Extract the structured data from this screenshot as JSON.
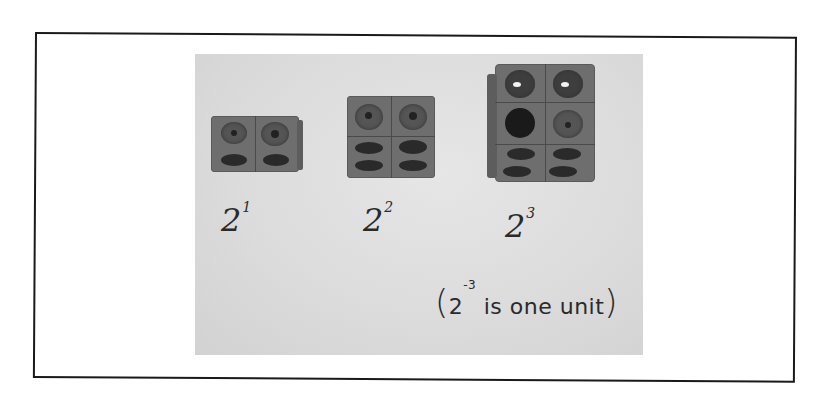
{
  "figure": {
    "frame": {
      "border_color": "#1a1a1a"
    },
    "photo": {
      "background": "#dcdcdc"
    },
    "groups": [
      {
        "label_base": "2",
        "label_exponent": "1",
        "cube_count": 2,
        "arrangement": "1 × 2"
      },
      {
        "label_base": "2",
        "label_exponent": "2",
        "cube_count": 4,
        "arrangement": "2 × 2"
      },
      {
        "label_base": "2",
        "label_exponent": "3",
        "cube_count": 8,
        "arrangement": "2 × 2 × 2"
      }
    ],
    "note": {
      "open_paren": "(",
      "base": "2",
      "exponent": "-3",
      "text": " is one unit",
      "close_paren": ")"
    }
  }
}
